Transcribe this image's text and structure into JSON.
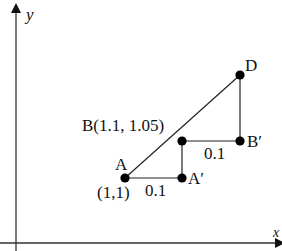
{
  "axes": {
    "x_label": "x",
    "y_label": "y"
  },
  "points": {
    "A": {
      "label": "A",
      "coord_label": "(1,1)"
    },
    "A_prime": {
      "label": "A′"
    },
    "B": {
      "label": "B(1.1, 1.05)"
    },
    "B_prime": {
      "label": "B′"
    },
    "D": {
      "label": "D"
    }
  },
  "segments": {
    "AA_prime": {
      "label": "0.1"
    },
    "BB_prime": {
      "label": "0.1"
    }
  },
  "colors": {
    "stroke": "#222222",
    "point": "#000000"
  }
}
